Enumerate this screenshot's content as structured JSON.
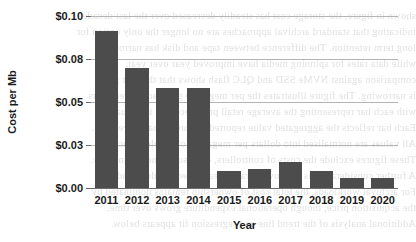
{
  "chart_data": {
    "type": "bar",
    "title": "",
    "xlabel": "Year",
    "ylabel": "Cost per Mb",
    "categories": [
      "2011",
      "2012",
      "2013",
      "2014",
      "2015",
      "2016",
      "2017",
      "2018",
      "2019",
      "2020"
    ],
    "values": [
      0.091,
      0.07,
      0.058,
      0.058,
      0.01,
      0.011,
      0.015,
      0.01,
      0.006,
      0.006
    ],
    "ylim": [
      0.0,
      0.1
    ],
    "ytick_values": [
      0.1,
      0.075,
      0.05,
      0.025,
      0.0
    ],
    "ytick_labels": [
      "$0.10",
      "$0.08",
      "$0.05",
      "$0.03",
      "$0.00"
    ],
    "grid": "horizontal",
    "legend": "none",
    "bar_color": "#4c4c4c",
    "gridline_color": "#b4b4b4",
    "axis_color": "#6b6b6b",
    "background_color": "#ffffff",
    "text_color": "#1a1a1a"
  },
  "background_text": {
    "lines": [
      "shown in figure, the storage cost has steadily decreased over the last decade",
      "indicating that standard archival approaches are no longer the only option for",
      "long term retention. The difference between tape and disk has narrowed",
      "while data rates for spinning media have improved year over year.",
      "comparison against NVMe SSD and QLC flash shows that the cost gap",
      "is narrowing. The figure illustrates the per megabyte price across ten years",
      "with each bar representing the average retail price recorded in January.",
      "Each bar reflects the aggregated value reported by three separate vendors.",
      "All values are normalised into dollars per megabyte of usable capacity.",
      "These figures exclude the costs of controllers, enclosures and redundancy.",
      "A further consideration is the power draw of each medium during idle.",
      "For archival workloads, the total cost of ownership remains dominated by",
      "the acquisition price, though operational expenditure grows over time.",
      "Additional analysis of the trend line and regression fit appears below."
    ]
  }
}
